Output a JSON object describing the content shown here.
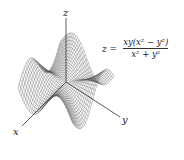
{
  "figure": {
    "type": "3d-wireframe-surface",
    "function": "z = xy(x^2 - y^2)/(x^2 + y^2)",
    "formula": {
      "lhs": "z =",
      "numerator": "xy(x² − y²)",
      "denominator": "x² + y²"
    },
    "axes": {
      "x_label": "x",
      "y_label": "y",
      "z_label": "z"
    },
    "colors": {
      "mesh": "#555555",
      "axis": "#333333",
      "background": "#ffffff"
    },
    "grid": {
      "domain": [
        -2,
        2
      ],
      "lines": 34
    }
  }
}
